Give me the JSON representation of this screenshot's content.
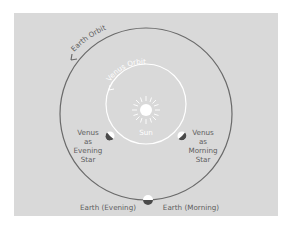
{
  "diagram": {
    "background": "#d9d9d9",
    "earth_orbit": {
      "label": "Earth Orbit",
      "color": "#6a6a6a"
    },
    "venus_orbit": {
      "label": "Venus Orbit",
      "color": "#ffffff"
    },
    "sun": {
      "label": "Sun"
    },
    "venus_evening": {
      "lines": [
        "Venus",
        "as",
        "Evening",
        "Star"
      ]
    },
    "venus_morning": {
      "lines": [
        "Venus",
        "as",
        "Morning",
        "Star"
      ]
    },
    "earth_evening": {
      "label": "Earth (Evening)"
    },
    "earth_morning": {
      "label": "Earth (Morning)"
    }
  }
}
